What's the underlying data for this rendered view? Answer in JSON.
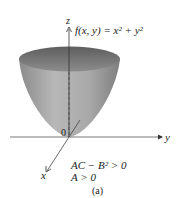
{
  "figure": {
    "function_label": "f(x, y) = x² + y²",
    "axes": {
      "x": "x",
      "y": "y",
      "z": "z",
      "origin": "0"
    },
    "conditions": [
      "AC − B² > 0",
      "A > 0"
    ],
    "caption": "(a)",
    "colors": {
      "surface_light": "#b5b5b5",
      "surface_dark": "#7a7a7a",
      "rim": "#6e6e6e",
      "axis": "#333333"
    }
  }
}
